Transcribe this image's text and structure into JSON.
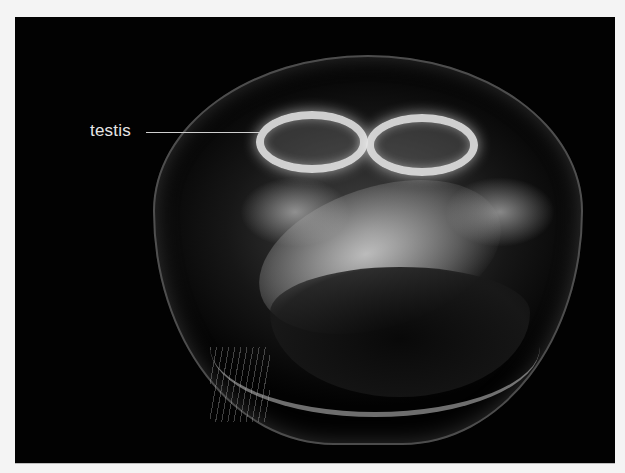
{
  "image": {
    "subject": "moon jellyfish, underside view on black background",
    "background_color": "#020202",
    "page_color": "#f4f4f4"
  },
  "annotations": [
    {
      "label": "testis",
      "color": "#e6e6e6"
    }
  ]
}
